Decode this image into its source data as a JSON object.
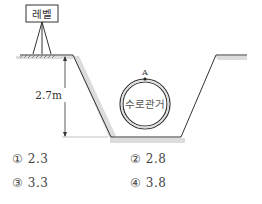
{
  "diagram": {
    "level_label": "레벨",
    "depth_label": "2.7m",
    "pipe_label": "수로관거",
    "point_label": "A",
    "colors": {
      "line": "#333333",
      "shadow": "#d9d9d9"
    }
  },
  "choices": [
    {
      "number": "①",
      "value": "2.3"
    },
    {
      "number": "②",
      "value": "2.8"
    },
    {
      "number": "③",
      "value": "3.3"
    },
    {
      "number": "④",
      "value": "3.8"
    }
  ]
}
